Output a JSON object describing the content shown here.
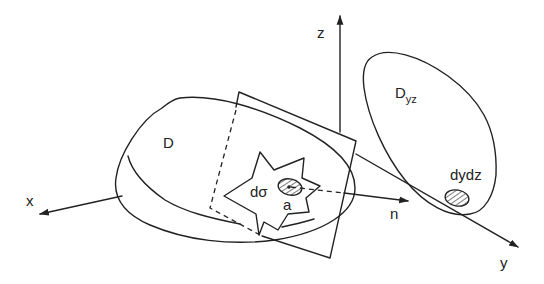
{
  "diagram": {
    "colors": {
      "ink": "#222222",
      "background": "#ffffff"
    },
    "axes": {
      "x": {
        "label": "x"
      },
      "y": {
        "label": "y"
      },
      "z": {
        "label": "z"
      }
    },
    "surface": {
      "label": "D"
    },
    "element": {
      "label": "dσ",
      "point_label": "a"
    },
    "normal": {
      "label": "n"
    },
    "projection": {
      "label_main": "D",
      "label_sub": "yz",
      "element_label": "dydz"
    }
  }
}
